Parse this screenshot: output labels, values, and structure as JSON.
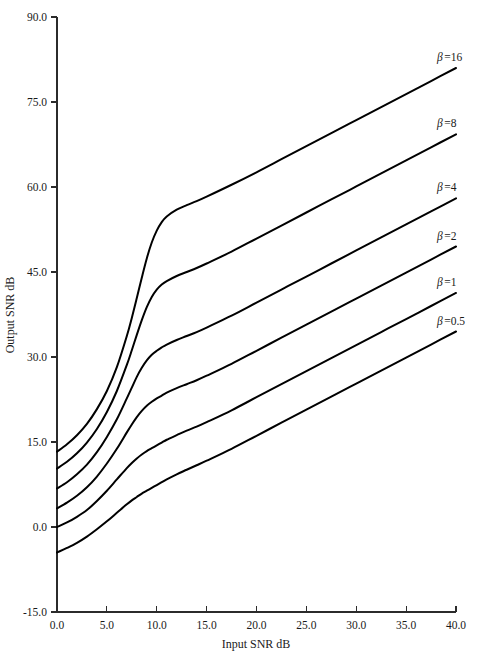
{
  "chart_data": {
    "type": "line",
    "title": "",
    "xlabel": "Input SNR dB",
    "ylabel": "Output SNR dB",
    "xlim": [
      0.0,
      40.0
    ],
    "ylim": [
      -15.0,
      90.0
    ],
    "xticks": [
      "0.0",
      "5.0",
      "10.0",
      "15.0",
      "20.0",
      "25.0",
      "30.0",
      "35.0",
      "40.0"
    ],
    "yticks": [
      "90.0",
      "75.0",
      "60.0",
      "45.0",
      "30.0",
      "15.0",
      "0.0",
      "-15.0"
    ],
    "xtick_values": [
      0,
      5,
      10,
      15,
      20,
      25,
      30,
      35,
      40
    ],
    "ytick_values": [
      90,
      75,
      60,
      45,
      30,
      15,
      0,
      -15
    ],
    "grid": false,
    "legend_position": "inline-right",
    "series": [
      {
        "name": "beta-16",
        "label_prefix": "β",
        "label_eq": "=",
        "label_value": "16",
        "label_full": "β =16",
        "x": [
          0,
          1,
          2,
          3,
          4,
          5,
          6,
          7,
          7.5,
          8,
          8.5,
          9,
          9.5,
          10,
          10.5,
          11,
          12,
          13,
          14,
          15,
          17.5,
          20,
          22.5,
          25,
          27.5,
          30,
          32.5,
          35,
          37.5,
          40
        ],
        "y": [
          13.3,
          14.6,
          16.2,
          18.2,
          20.8,
          24.0,
          28.2,
          33.7,
          36.9,
          40.4,
          44.0,
          47.4,
          50.2,
          52.3,
          53.8,
          54.8,
          56.0,
          56.8,
          57.5,
          58.3,
          60.4,
          62.6,
          64.9,
          67.2,
          69.5,
          71.8,
          74.1,
          76.4,
          78.7,
          81.0
        ]
      },
      {
        "name": "beta-8",
        "label_prefix": "β",
        "label_eq": "=",
        "label_value": "8",
        "label_full": "β =8",
        "x": [
          0,
          1,
          2,
          3,
          4,
          5,
          6,
          7,
          7.5,
          8,
          8.5,
          9,
          9.5,
          10,
          10.5,
          11,
          12,
          13,
          14,
          15,
          17.5,
          20,
          22.5,
          25,
          27.5,
          30,
          32.5,
          35,
          37.5,
          40
        ],
        "y": [
          10.3,
          11.5,
          13.0,
          14.9,
          17.3,
          20.3,
          24.0,
          28.6,
          31.2,
          33.9,
          36.5,
          38.8,
          40.6,
          41.9,
          42.8,
          43.4,
          44.3,
          45.0,
          45.7,
          46.5,
          48.6,
          50.9,
          53.2,
          55.5,
          57.8,
          60.1,
          62.4,
          64.7,
          67.0,
          69.3
        ]
      },
      {
        "name": "beta-4",
        "label_prefix": "β",
        "label_eq": "=",
        "label_value": "4",
        "label_full": "β =4",
        "x": [
          0,
          1,
          2,
          3,
          4,
          5,
          6,
          7,
          7.5,
          8,
          8.5,
          9,
          9.5,
          10,
          10.5,
          11,
          12,
          13,
          14,
          15,
          17.5,
          20,
          22.5,
          25,
          27.5,
          30,
          32.5,
          35,
          37.5,
          40
        ],
        "y": [
          6.8,
          7.9,
          9.3,
          11.0,
          13.2,
          15.9,
          19.0,
          22.7,
          24.6,
          26.5,
          28.1,
          29.4,
          30.4,
          31.1,
          31.7,
          32.2,
          33.0,
          33.7,
          34.4,
          35.2,
          37.3,
          39.6,
          41.9,
          44.2,
          46.5,
          48.8,
          51.1,
          53.4,
          55.7,
          58.0
        ]
      },
      {
        "name": "beta-2",
        "label_prefix": "β",
        "label_eq": "=",
        "label_value": "2",
        "label_full": "β =2",
        "x": [
          0,
          1,
          2,
          3,
          4,
          5,
          6,
          7,
          7.5,
          8,
          8.5,
          9,
          9.5,
          10,
          10.5,
          11,
          12,
          13,
          14,
          15,
          17.5,
          20,
          22.5,
          25,
          27.5,
          30,
          32.5,
          35,
          37.5,
          40
        ],
        "y": [
          3.3,
          4.3,
          5.5,
          7.0,
          8.9,
          11.2,
          13.8,
          16.7,
          18.1,
          19.4,
          20.5,
          21.4,
          22.1,
          22.7,
          23.2,
          23.7,
          24.5,
          25.2,
          25.9,
          26.7,
          28.8,
          31.1,
          33.4,
          35.7,
          38.0,
          40.3,
          42.6,
          44.9,
          47.2,
          49.5
        ]
      },
      {
        "name": "beta-1",
        "label_prefix": "β",
        "label_eq": "=",
        "label_value": "1",
        "label_full": "β =1",
        "x": [
          0,
          1,
          2,
          3,
          4,
          5,
          6,
          7,
          7.5,
          8,
          8.5,
          9,
          9.5,
          10,
          10.5,
          11,
          12,
          13,
          14,
          15,
          17.5,
          20,
          22.5,
          25,
          27.5,
          30,
          32.5,
          35,
          37.5,
          40
        ],
        "y": [
          0.0,
          0.8,
          1.8,
          3.0,
          4.6,
          6.4,
          8.4,
          10.4,
          11.3,
          12.1,
          12.8,
          13.4,
          13.9,
          14.4,
          14.9,
          15.4,
          16.2,
          17.0,
          17.7,
          18.5,
          20.6,
          22.9,
          25.2,
          27.5,
          29.8,
          32.1,
          34.4,
          36.7,
          39.0,
          41.3
        ]
      },
      {
        "name": "beta-0.5",
        "label_prefix": "β",
        "label_eq": "=",
        "label_value": "0.5",
        "label_full": "β =0.5",
        "x": [
          0,
          1,
          2,
          3,
          4,
          5,
          6,
          7,
          7.5,
          8,
          8.5,
          9,
          9.5,
          10,
          10.5,
          11,
          12,
          13,
          14,
          15,
          17.5,
          20,
          22.5,
          25,
          27.5,
          30,
          32.5,
          35,
          37.5,
          40
        ],
        "y": [
          -4.5,
          -3.7,
          -2.8,
          -1.7,
          -0.4,
          1.0,
          2.5,
          4.0,
          4.7,
          5.3,
          5.9,
          6.4,
          6.9,
          7.4,
          7.9,
          8.4,
          9.3,
          10.1,
          10.9,
          11.7,
          13.8,
          16.1,
          18.4,
          20.7,
          23.0,
          25.3,
          27.6,
          29.9,
          32.2,
          34.5
        ]
      }
    ]
  },
  "colors": {
    "curve": "#000000",
    "axis": "#2b2b2b",
    "text": "#1a1a1a",
    "background": "#ffffff"
  }
}
